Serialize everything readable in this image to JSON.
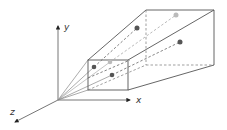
{
  "diagram": {
    "axes": {
      "x": {
        "label": "x"
      },
      "y": {
        "label": "y"
      },
      "z": {
        "label": "z"
      }
    },
    "colors": {
      "line": "#555555",
      "dashed": "#777777",
      "dot_dark": "#555555",
      "dot_light": "#bbbbbb"
    },
    "points": [
      {
        "name": "near-dark-point-1",
        "shade": "dark"
      },
      {
        "name": "near-light-point",
        "shade": "light"
      },
      {
        "name": "near-dark-point-2",
        "shade": "dark"
      },
      {
        "name": "far-dark-point-1",
        "shade": "dark"
      },
      {
        "name": "far-light-point",
        "shade": "light"
      },
      {
        "name": "far-dark-point-2",
        "shade": "dark"
      }
    ]
  }
}
